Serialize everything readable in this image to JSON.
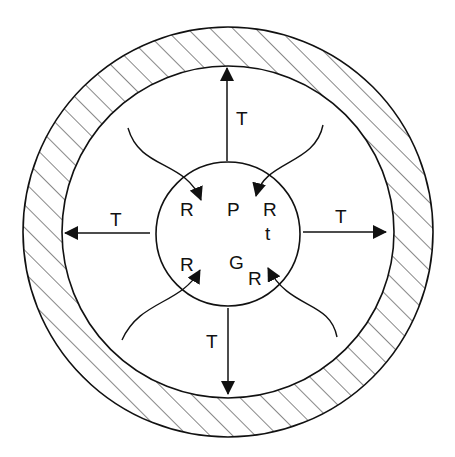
{
  "diagram": {
    "colors": {
      "stroke": "#111111",
      "background": "#ffffff"
    },
    "labels": {
      "inner": {
        "P": "P",
        "G": "G",
        "t": "t",
        "R_top_left": "R",
        "R_top_right": "R",
        "R_bottom_left": "R",
        "R_bottom_right": "R"
      },
      "arrows": {
        "top": "T",
        "left": "T",
        "right": "T",
        "bottom": "T"
      }
    }
  }
}
